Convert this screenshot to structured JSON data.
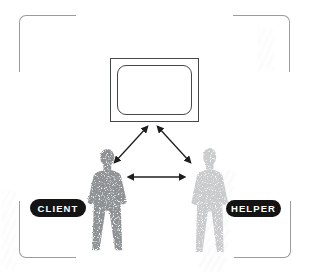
{
  "diagram": {
    "labels": {
      "client": "CLIENT",
      "helper": "HELPER"
    },
    "icons": {
      "tv": "tv-icon",
      "client_figure": "person-silhouette-dark",
      "helper_figure": "person-silhouette-light",
      "arrow_tv_client": "double-arrow",
      "arrow_tv_helper": "double-arrow",
      "arrow_client_helper": "double-arrow"
    },
    "colors": {
      "background": "#ffffff",
      "frame": "#9c9c9c",
      "tv_border": "#44484b",
      "arrow": "#1e1e1e",
      "label_bg": "#141414",
      "label_text": "#ffffff",
      "client_fill": "#8f9295",
      "helper_fill": "#c9cbcc"
    }
  }
}
